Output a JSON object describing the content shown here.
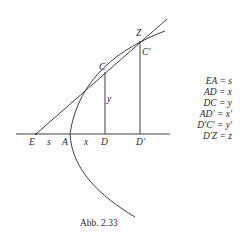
{
  "figure": {
    "caption": "Abb. 2.33",
    "colors": {
      "stroke": "#2a2a2a",
      "background": "#ffffff"
    },
    "points": {
      "E": "E",
      "A": "A",
      "D": "D",
      "D_prime": "D′",
      "C": "C",
      "C_prime": "C′",
      "Z": "Z"
    },
    "segment_labels": {
      "s": "s",
      "x": "x",
      "y": "y"
    },
    "legend": [
      {
        "lhs": "EA",
        "rhs": "s"
      },
      {
        "lhs": "AD",
        "rhs": "x"
      },
      {
        "lhs": "DC",
        "rhs": "y"
      },
      {
        "lhs": "AD′",
        "rhs": "x′"
      },
      {
        "lhs": "D′C′",
        "rhs": "y′"
      },
      {
        "lhs": "D′Z",
        "rhs": "z"
      }
    ],
    "legend_text": [
      "EA = s",
      "AD = x",
      "DC = y",
      "AD′ = x′",
      "D′C′ = y′",
      "D′Z = z"
    ]
  }
}
